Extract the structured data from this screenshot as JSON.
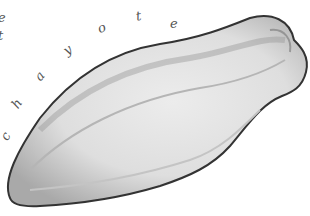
{
  "image": {
    "description": "Pencil sketch of a chayote squash with the word 'chayote' written in an arc above it",
    "caption_letters": [
      "c",
      "h",
      "a",
      "y",
      "o",
      "t",
      "e"
    ],
    "edge_letters": [
      "e",
      "t"
    ],
    "colors": {
      "background": "#ffffff",
      "outline": "#3a3a3a",
      "body_light": "#e4e4e4",
      "body_shadow": "#a8a8a8",
      "letters": "#555555"
    }
  }
}
